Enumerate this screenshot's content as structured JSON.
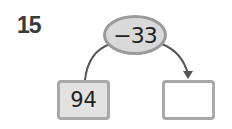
{
  "problem": {
    "number": "15",
    "operation": "−33",
    "input_value": "94",
    "output_value": ""
  },
  "colors": {
    "ellipse_fill": "#d9d9d9",
    "ellipse_border": "#9a9a9a",
    "input_box_fill": "#e2e2e2",
    "box_border": "#a8a8a8",
    "arrow": "#555555"
  }
}
